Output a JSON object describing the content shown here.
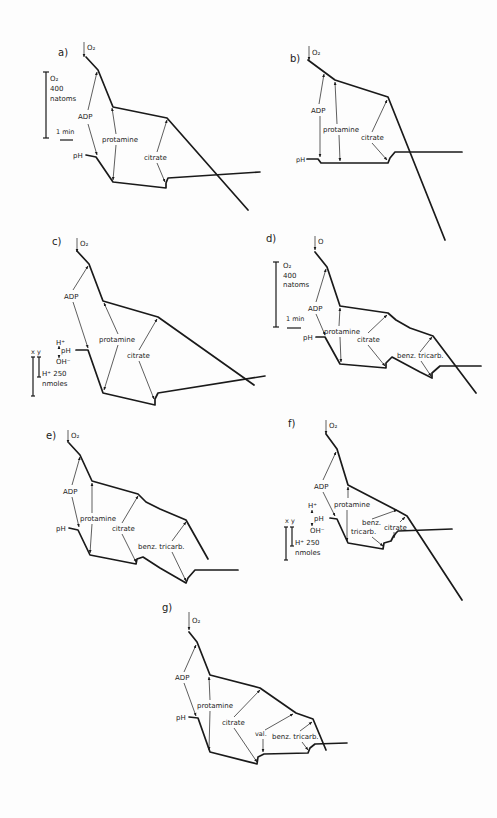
{
  "figure": {
    "panels": [
      {
        "id": "a",
        "label": "a)",
        "o2": "O₂",
        "additions": [
          "ADP",
          "protamine",
          "citrate"
        ]
      },
      {
        "id": "b",
        "label": "b)",
        "o2": "O₂",
        "additions": [
          "ADP",
          "protamine",
          "citrate"
        ]
      },
      {
        "id": "c",
        "label": "c)",
        "o2": "O₂",
        "additions": [
          "ADP",
          "protamine",
          "citrate"
        ]
      },
      {
        "id": "d",
        "label": "d)",
        "o2": "O",
        "additions": [
          "ADP",
          "protamine",
          "citrate",
          "benz. tricarb."
        ]
      },
      {
        "id": "e",
        "label": "e)",
        "o2": "O₂",
        "additions": [
          "ADP",
          "protamine",
          "citrate",
          "benz. tricarb."
        ]
      },
      {
        "id": "f",
        "label": "f)",
        "o2": "O₂",
        "additions": [
          "ADP",
          "protamine",
          "benz. tricarb.",
          "citrate"
        ]
      },
      {
        "id": "g",
        "label": "g)",
        "o2": "O₂",
        "additions": [
          "ADP",
          "protamine",
          "citrate",
          "val.",
          "benz. tricarb."
        ]
      }
    ],
    "labels": {
      "adp": "ADP",
      "protamine": "protamine",
      "citrate": "citrate",
      "benz": "benz. tricarb.",
      "benz_line1": "benz.",
      "benz_line2": "tricarb.",
      "val": "val.",
      "ph": "pH",
      "h_plus": "H⁺",
      "oh_minus": "OH⁻"
    },
    "scales": {
      "o2_title": "O₂",
      "o2_value": "400",
      "o2_unit": "natoms",
      "time": "1 min",
      "xy": "x y",
      "h_value": "H⁺ 250",
      "h_unit": "nmoles"
    }
  }
}
